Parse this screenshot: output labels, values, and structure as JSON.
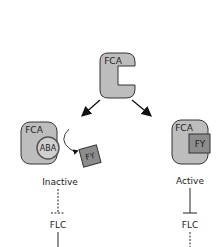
{
  "diagram": {
    "top": {
      "protein_label": "FCA"
    },
    "left_branch": {
      "complex_labels": {
        "fca": "FCA",
        "ligand": "ABA",
        "released": "FY"
      },
      "state": "Inactive",
      "target": "FLC",
      "repression": "dashed"
    },
    "right_branch": {
      "complex_labels": {
        "fca": "FCA",
        "partner": "FY"
      },
      "state": "Active",
      "target": "FLC",
      "repression": "solid"
    },
    "colors": {
      "protein_fill": "#bdbdbd",
      "fy_fill": "#8c8c8c",
      "aba_fill": "#cfcfcf",
      "stroke": "#333333"
    }
  }
}
